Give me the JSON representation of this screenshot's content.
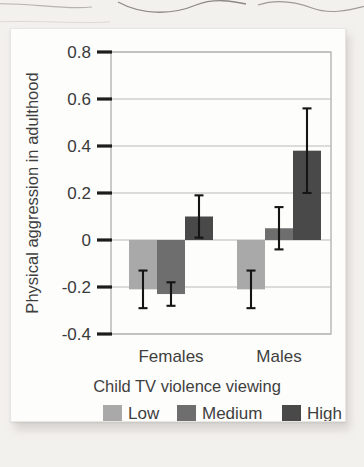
{
  "figure": {
    "background_color": "#f3f1ee",
    "card_color": "#fdfdfc"
  },
  "chart_data": {
    "type": "bar",
    "title": "",
    "subtitle": "",
    "xlabel": "Child TV violence viewing",
    "ylabel": "Physical aggression in adulthood",
    "categories": [
      "Females",
      "Males"
    ],
    "ylim": [
      -0.4,
      0.8
    ],
    "yticks": [
      -0.4,
      -0.2,
      0,
      0.2,
      0.4,
      0.6,
      0.8
    ],
    "ytick_labels": [
      "-0.4",
      "-0.2",
      "0",
      "0.2",
      "0.4",
      "0.6",
      "0.8"
    ],
    "grid": true,
    "grid_axis": "y",
    "legend_position": "bottom",
    "error_bars": "symmetric",
    "series": [
      {
        "name": "Low",
        "color": "#a9a9a9",
        "values": [
          -0.21,
          -0.21
        ],
        "errors": [
          0.08,
          0.08
        ]
      },
      {
        "name": "Medium",
        "color": "#6e6e6e",
        "values": [
          -0.23,
          0.05
        ],
        "errors": [
          0.05,
          0.09
        ]
      },
      {
        "name": "High",
        "color": "#494949",
        "values": [
          0.1,
          0.38
        ],
        "errors": [
          0.09,
          0.18
        ]
      }
    ]
  },
  "axis": {
    "y_title": "Physical aggression in adulthood",
    "x_title": "Child TV violence viewing",
    "tick_0": "0.8",
    "tick_1": "0.6",
    "tick_2": "0.4",
    "tick_3": "0.2",
    "tick_4": "0",
    "tick_5": "-0.2",
    "tick_6": "-0.4",
    "cat_0": "Females",
    "cat_1": "Males"
  },
  "legend": {
    "items": [
      {
        "label": "Low",
        "color": "#a9a9a9"
      },
      {
        "label": "Medium",
        "color": "#6e6e6e"
      },
      {
        "label": "High",
        "color": "#494949"
      }
    ],
    "label_0": "Low",
    "label_1": "Medium",
    "label_2": "High"
  }
}
